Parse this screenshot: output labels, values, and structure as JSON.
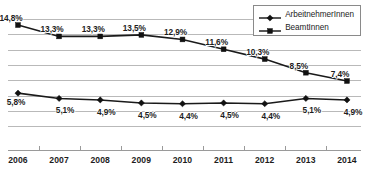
{
  "chart_data": {
    "type": "line",
    "title": "",
    "subtitle": "",
    "xlabel": "",
    "ylabel": "",
    "categories": [
      "2006",
      "2007",
      "2008",
      "2009",
      "2010",
      "2011",
      "2012",
      "2013",
      "2014"
    ],
    "series": [
      {
        "name": "ArbeitnehmerInnen",
        "marker": "diamond",
        "color": "#111111",
        "values": [
          5.8,
          5.1,
          4.9,
          4.5,
          4.4,
          4.5,
          4.4,
          5.1,
          4.9
        ],
        "labels": [
          "5,8%",
          "5,1%",
          "4,9%",
          "4,5%",
          "4,4%",
          "4,5%",
          "4,4%",
          "5,1%",
          "4,9%"
        ]
      },
      {
        "name": "BeamtInnen",
        "marker": "square",
        "color": "#111111",
        "values": [
          14.8,
          13.3,
          13.3,
          13.5,
          12.9,
          11.6,
          10.3,
          8.5,
          7.4
        ],
        "labels": [
          "14,8%",
          "13,3%",
          "13,3%",
          "13,5%",
          "12,9%",
          "11,6%",
          "10,3%",
          "8,5%",
          "7,4%"
        ]
      }
    ],
    "ylim": [
      0,
      16
    ],
    "yticklabels": [],
    "grid": true,
    "gridlines": 8,
    "legend_position": "top-right",
    "value_labels_shown": true,
    "unit": "%"
  },
  "legend": {
    "entries": [
      {
        "label": "ArbeitnehmerInnen",
        "marker": "diamond"
      },
      {
        "label": "BeamtInnen",
        "marker": "square"
      }
    ]
  },
  "axis": {
    "x_tick_labels": [
      "2006",
      "2007",
      "2008",
      "2009",
      "2010",
      "2011",
      "2012",
      "2013",
      "2014"
    ]
  }
}
